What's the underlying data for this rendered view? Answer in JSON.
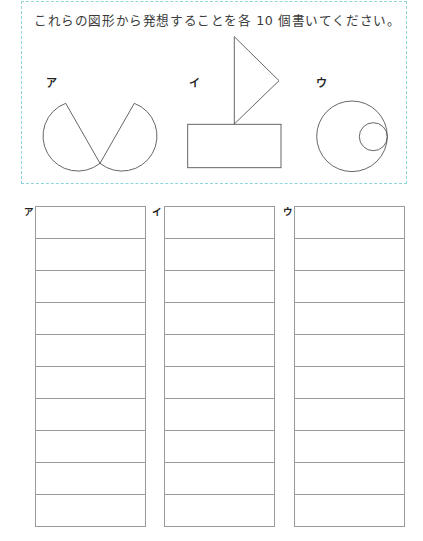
{
  "instruction": "これらの図形から発想することを各 10 個書いてください。",
  "figures": [
    {
      "label": "ア",
      "description": "two circles each with a chord cut, chords meeting at bottom"
    },
    {
      "label": "イ",
      "description": "triangle standing on a rectangle"
    },
    {
      "label": "ウ",
      "description": "large circle with small internally tangent circle on right"
    }
  ],
  "answer_columns": [
    {
      "label": "ア",
      "rows": [
        "",
        "",
        "",
        "",
        "",
        "",
        "",
        "",
        "",
        ""
      ]
    },
    {
      "label": "イ",
      "rows": [
        "",
        "",
        "",
        "",
        "",
        "",
        "",
        "",
        "",
        ""
      ]
    },
    {
      "label": "ウ",
      "rows": [
        "",
        "",
        "",
        "",
        "",
        "",
        "",
        "",
        "",
        ""
      ]
    }
  ],
  "colors": {
    "dashed_border": "#8fd6dc",
    "grid_lines": "#9a9a9a",
    "shape_stroke": "#555555",
    "text": "#3a3a3a"
  }
}
